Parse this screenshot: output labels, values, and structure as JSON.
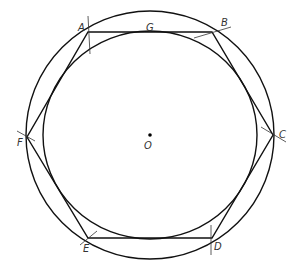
{
  "diagram": {
    "type": "geometric-construction",
    "center": {
      "label": "O",
      "x": 150,
      "y": 135
    },
    "outer_circle": {
      "cx": 150,
      "cy": 135,
      "r": 124
    },
    "inner_circle": {
      "cx": 150,
      "cy": 135,
      "rx": 107,
      "ry": 104
    },
    "vertices": [
      {
        "label": "A",
        "x": 88,
        "y": 32,
        "lx": 79,
        "ly": 29
      },
      {
        "label": "B",
        "x": 212,
        "y": 32,
        "lx": 222,
        "ly": 25
      },
      {
        "label": "C",
        "x": 273,
        "y": 135,
        "lx": 280,
        "ly": 137
      },
      {
        "label": "D",
        "x": 212,
        "y": 238,
        "lx": 214,
        "ly": 250
      },
      {
        "label": "E",
        "x": 88,
        "y": 238,
        "lx": 83,
        "ly": 252
      },
      {
        "label": "F",
        "x": 27,
        "y": 137,
        "lx": 17,
        "ly": 145
      }
    ],
    "tangent_point": {
      "label": "G",
      "lx": 146,
      "ly": 29
    },
    "line_color": "#111111",
    "label_color": "#333333"
  }
}
